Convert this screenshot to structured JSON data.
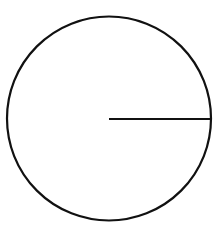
{
  "diagram": {
    "type": "circle-with-radius",
    "circle": {
      "cx": 109,
      "cy": 118.5,
      "r": 102,
      "stroke": "#111111",
      "stroke_width": 2.2,
      "fill": "#ffffff"
    },
    "radius_line": {
      "x1": 109,
      "y1": 119,
      "x2": 211,
      "y2": 119,
      "stroke": "#111111",
      "stroke_width": 2.2
    },
    "labels": []
  }
}
